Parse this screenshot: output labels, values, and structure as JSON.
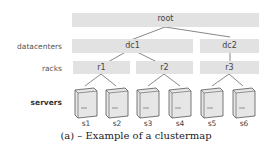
{
  "levels": {
    "datacenters": "datacenters",
    "racks": "racks",
    "servers": "servers"
  },
  "nodes": {
    "root": "root",
    "dc1": "dc1",
    "dc2": "dc2",
    "r1": "r1",
    "r2": "r2",
    "r3": "r3"
  },
  "servers": [
    "s1",
    "s2",
    "s3",
    "s4",
    "s5",
    "s6"
  ],
  "caption": "(a) – Example of a clustermap"
}
